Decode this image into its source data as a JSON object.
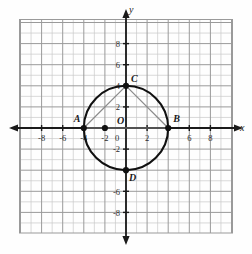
{
  "figure": {
    "title": "",
    "axis_labels": {
      "x": "x",
      "y": "y"
    },
    "origin_label": "O",
    "zero_label": "0"
  },
  "chart_data": {
    "type": "scatter",
    "title": "",
    "xlabel": "x",
    "ylabel": "y",
    "xlim": [
      -10,
      10
    ],
    "ylim": [
      -10,
      10
    ],
    "grid": true,
    "minor_grid_step": 1,
    "major_grid_step": 2,
    "legend": "none",
    "x_tick_labels": [
      "-8",
      "-6",
      "-4",
      "-2",
      "0",
      "2",
      "4",
      "6",
      "8"
    ],
    "x_tick_values": [
      -8,
      -6,
      -4,
      -2,
      0,
      2,
      4,
      6,
      8
    ],
    "x_tick_hidden": [
      4
    ],
    "y_tick_labels": [
      "8",
      "6",
      "4",
      "2",
      "-2",
      "-4",
      "-6",
      "-8"
    ],
    "y_tick_values": [
      8,
      6,
      4,
      2,
      -2,
      -4,
      -6,
      -8
    ],
    "y_tick_hidden": [
      -4
    ],
    "shapes": [
      {
        "kind": "circle",
        "center": [
          0,
          0
        ],
        "radius": 4,
        "stroke": "#111111",
        "fill": "none"
      },
      {
        "kind": "segment",
        "from": [
          -4,
          0
        ],
        "to": [
          0,
          4
        ],
        "stroke": "#8a8a8a"
      },
      {
        "kind": "segment",
        "from": [
          0,
          4
        ],
        "to": [
          4,
          0
        ],
        "stroke": "#8a8a8a"
      },
      {
        "kind": "segment",
        "from": [
          -4,
          0
        ],
        "to": [
          4,
          0
        ],
        "stroke": "#8a8a8a"
      }
    ],
    "points": [
      {
        "label": "A",
        "x": -4,
        "y": 0,
        "label_dx": -10,
        "label_dy": -6
      },
      {
        "label": "B",
        "x": 4,
        "y": 0,
        "label_dx": 5,
        "label_dy": -6
      },
      {
        "label": "C",
        "x": 0,
        "y": 4,
        "label_dx": 5,
        "label_dy": -4
      },
      {
        "label": "D",
        "x": 0,
        "y": -4,
        "label_dx": 3,
        "label_dy": 11
      },
      {
        "label": "",
        "x": -2,
        "y": 0,
        "label_dx": 0,
        "label_dy": 0
      }
    ],
    "colors": {
      "minor_grid": "#c9c9c9",
      "major_grid": "#9a9a9a",
      "axis": "#1a1a1a",
      "circle": "#111111",
      "chord": "#8a8a8a",
      "point": "#111111",
      "background": "#fefefe"
    }
  }
}
